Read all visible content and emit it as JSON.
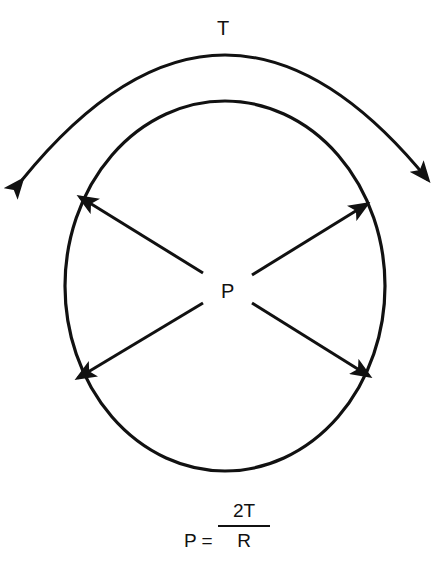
{
  "diagram": {
    "torque_label": "T",
    "pressure_label": "P",
    "formula": {
      "lhs": "P =",
      "numerator": "2T",
      "denominator": "R"
    },
    "colors": {
      "stroke": "#111111",
      "background": "#ffffff"
    }
  }
}
